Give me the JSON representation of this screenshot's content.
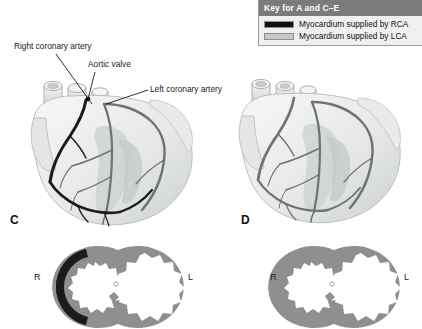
{
  "figure": {
    "background_color": "#ffffff"
  },
  "legend": {
    "header": "Key for A and C–E",
    "items": [
      {
        "label": "Myocardium supplied by RCA",
        "swatch_color": "#111111",
        "artery": "RCA"
      },
      {
        "label": "Myocardium supplied by LCA",
        "swatch_color": "#c9c9c9",
        "artery": "LCA"
      }
    ]
  },
  "callouts": [
    {
      "id": "right-coronary-artery",
      "text": "Right coronary artery"
    },
    {
      "id": "aortic-valve",
      "text": "Aortic valve"
    },
    {
      "id": "left-coronary-artery",
      "text": "Left coronary artery"
    }
  ],
  "panels": [
    {
      "letter": "C",
      "heart": {
        "description": "Anterior view of heart with right-dominant coronary circulation",
        "rca_color": "#1b1b1b",
        "lca_color": "#6f7274",
        "myocardium_color": "#eceded"
      },
      "cross_section": {
        "left_marker": "R",
        "right_marker": "L",
        "rca_territory_color": "#1b1b1b",
        "lca_territory_color": "#8d8f91"
      }
    },
    {
      "letter": "D",
      "heart": {
        "description": "Anterior view of heart with left-dominant coronary circulation",
        "rca_color": "#6f7274",
        "lca_color": "#6f7274",
        "myocardium_color": "#eceded"
      },
      "cross_section": {
        "left_marker": "R",
        "right_marker": "L",
        "rca_territory_color": "#8d8f91",
        "lca_territory_color": "#8d8f91"
      }
    }
  ],
  "colors": {
    "legend_header_bg": "#7b7b7b",
    "legend_body_bg": "#f0f0f0",
    "legend_border": "#9a9a9a",
    "text": "#1a1a1a",
    "vessel_dark": "#1b1b1b",
    "vessel_gray": "#6f7274",
    "myocardium_light": "#eceded",
    "myocardium_mid": "#d3d5d6",
    "myocardium_shadow": "#bfc2c3"
  }
}
